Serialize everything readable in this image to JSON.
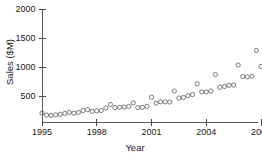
{
  "chart_data": {
    "type": "scatter",
    "title": "",
    "xlabel": "Year",
    "ylabel": "Sales ($M)",
    "xlim": [
      1994.8,
      2008.3
    ],
    "ylim": [
      0,
      2080
    ],
    "grid": false,
    "legend": null,
    "marker": "open-circle",
    "marker_color": "#6b6b6b",
    "xticks": [
      1995,
      1998,
      2001,
      2004,
      2007
    ],
    "xticklabels": [
      "1995",
      "1998",
      "2001",
      "2004",
      "2007"
    ],
    "yticks": [
      500,
      1000,
      1500,
      2000
    ],
    "yticklabels": [
      "500",
      "1000",
      "1500",
      "2000"
    ],
    "points": [
      {
        "x": 1995.0,
        "y": 205
      },
      {
        "x": 1995.25,
        "y": 170
      },
      {
        "x": 1995.5,
        "y": 165
      },
      {
        "x": 1995.75,
        "y": 175
      },
      {
        "x": 1996.0,
        "y": 185
      },
      {
        "x": 1996.25,
        "y": 200
      },
      {
        "x": 1996.5,
        "y": 215
      },
      {
        "x": 1996.75,
        "y": 205
      },
      {
        "x": 1997.0,
        "y": 215
      },
      {
        "x": 1997.25,
        "y": 250
      },
      {
        "x": 1997.5,
        "y": 265
      },
      {
        "x": 1997.75,
        "y": 235
      },
      {
        "x": 1998.0,
        "y": 245
      },
      {
        "x": 1998.25,
        "y": 250
      },
      {
        "x": 1998.5,
        "y": 295
      },
      {
        "x": 1998.75,
        "y": 355
      },
      {
        "x": 1999.0,
        "y": 300
      },
      {
        "x": 1999.25,
        "y": 305
      },
      {
        "x": 1999.5,
        "y": 310
      },
      {
        "x": 1999.75,
        "y": 320
      },
      {
        "x": 2000.0,
        "y": 380
      },
      {
        "x": 2000.25,
        "y": 300
      },
      {
        "x": 2000.5,
        "y": 305
      },
      {
        "x": 2000.75,
        "y": 320
      },
      {
        "x": 2001.0,
        "y": 480
      },
      {
        "x": 2001.25,
        "y": 375
      },
      {
        "x": 2001.5,
        "y": 400
      },
      {
        "x": 2001.75,
        "y": 400
      },
      {
        "x": 2002.0,
        "y": 395
      },
      {
        "x": 2002.25,
        "y": 585
      },
      {
        "x": 2002.5,
        "y": 465
      },
      {
        "x": 2002.75,
        "y": 475
      },
      {
        "x": 2003.0,
        "y": 505
      },
      {
        "x": 2003.25,
        "y": 525
      },
      {
        "x": 2003.5,
        "y": 710
      },
      {
        "x": 2003.75,
        "y": 570
      },
      {
        "x": 2004.0,
        "y": 570
      },
      {
        "x": 2004.25,
        "y": 585
      },
      {
        "x": 2004.5,
        "y": 870
      },
      {
        "x": 2004.75,
        "y": 650
      },
      {
        "x": 2005.0,
        "y": 665
      },
      {
        "x": 2005.25,
        "y": 685
      },
      {
        "x": 2005.5,
        "y": 690
      },
      {
        "x": 2005.75,
        "y": 1035
      },
      {
        "x": 2006.0,
        "y": 835
      },
      {
        "x": 2006.25,
        "y": 830
      },
      {
        "x": 2006.5,
        "y": 840
      },
      {
        "x": 2006.75,
        "y": 1285
      },
      {
        "x": 2007.0,
        "y": 1010
      },
      {
        "x": 2007.25,
        "y": 1035
      },
      {
        "x": 2007.5,
        "y": 1040
      },
      {
        "x": 2007.75,
        "y": 1555
      },
      {
        "x": 2008.0,
        "y": 1215
      },
      {
        "x": 2008.25,
        "y": 1225
      },
      {
        "x": 2008.5,
        "y": 1195
      },
      {
        "x": 2008.75,
        "y": 1760
      },
      {
        "x": 2009.0,
        "y": 1420
      },
      {
        "x": 2009.25,
        "y": 1430
      },
      {
        "x": 2009.5,
        "y": 1635
      }
    ]
  }
}
